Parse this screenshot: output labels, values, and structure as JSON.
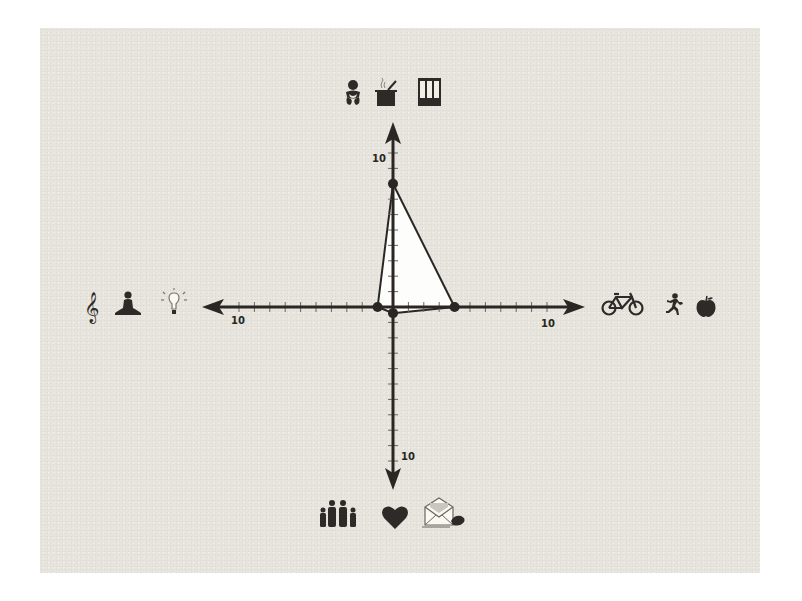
{
  "colors": {
    "background": "#ffffff",
    "panel": "#e6e4dc",
    "axis": "#2a2624",
    "polygon_fill": "#fdfdfb",
    "icon": "#2e2a28"
  },
  "axes": {
    "up": {
      "label": "10",
      "icons": [
        "baby-icon",
        "cooking-pot-icon",
        "binders-icon"
      ],
      "meaning": "Care / Home / Work"
    },
    "right": {
      "label": "10",
      "icons": [
        "bicycle-icon",
        "running-person-icon",
        "apple-icon"
      ],
      "meaning": "Fitness / Health"
    },
    "down": {
      "label": "10",
      "icons": [
        "family-icon",
        "heart-icon",
        "envelope-icon"
      ],
      "meaning": "Family / Love / Correspondence"
    },
    "left": {
      "label": "10",
      "icons": [
        "treble-clef-icon",
        "meditation-icon",
        "lightbulb-icon"
      ],
      "meaning": "Music / Mind / Ideas"
    }
  },
  "chart_data": {
    "type": "radar",
    "title": "",
    "axes": [
      "up",
      "right",
      "down",
      "left"
    ],
    "axis_max": 10,
    "tick_interval": 1,
    "tick_labels": [
      "10",
      "10",
      "10",
      "10"
    ],
    "values": {
      "up": 8,
      "right": 4,
      "down": 0.4,
      "left": 1
    },
    "series": [
      {
        "name": "balance",
        "values": [
          8,
          4,
          0.4,
          1
        ]
      }
    ],
    "grid": false,
    "legend": "icons at each axis end"
  }
}
